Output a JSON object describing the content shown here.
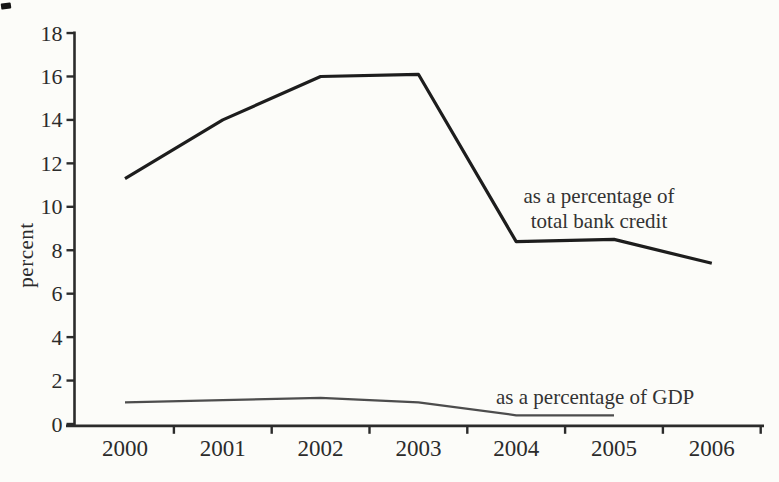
{
  "figure": {
    "background_color": "#fcfcf9",
    "axis_color": "#2b2b2b",
    "text_color": "#2b2b2b"
  },
  "chart_data": {
    "type": "line",
    "title": "",
    "xlabel": "",
    "ylabel": "percent",
    "categories": [
      "2000",
      "2001",
      "2002",
      "2003",
      "2004",
      "2005",
      "2006"
    ],
    "series": [
      {
        "name": "as a percentage of total bank credit",
        "values": [
          11.3,
          14,
          16,
          16.1,
          8.4,
          8.5,
          7.4
        ],
        "color": "#1d1d1d",
        "stroke_width": 3.2
      },
      {
        "name": "as a percentage of GDP",
        "values": [
          1.0,
          1.1,
          1.2,
          1.0,
          0.4,
          0.4,
          null
        ],
        "color": "#4d4d4d",
        "stroke_width": 2.2
      }
    ],
    "ylim": [
      0,
      18
    ],
    "ytick_step": 2,
    "grid": false,
    "legend_position": "inline-annotations",
    "annotations": [
      {
        "series": "total bank credit",
        "text_lines": [
          "as a percentage of",
          "total bank credit"
        ]
      },
      {
        "series": "GDP",
        "text_lines": [
          "as a percentage of GDP"
        ]
      }
    ]
  }
}
